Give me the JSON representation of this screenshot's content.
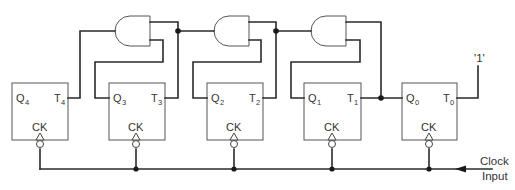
{
  "diagram": {
    "type": "synchronous binary counter (T flip-flops with AND gate carry chain)",
    "flip_flops": [
      {
        "id": "ff4",
        "q_label": "Q",
        "q_sub": "4",
        "t_label": "T",
        "t_sub": "4",
        "ck_label": "CK"
      },
      {
        "id": "ff3",
        "q_label": "Q",
        "q_sub": "3",
        "t_label": "T",
        "t_sub": "3",
        "ck_label": "CK"
      },
      {
        "id": "ff2",
        "q_label": "Q",
        "q_sub": "2",
        "t_label": "T",
        "t_sub": "2",
        "ck_label": "CK"
      },
      {
        "id": "ff1",
        "q_label": "Q",
        "q_sub": "1",
        "t_label": "T",
        "t_sub": "1",
        "ck_label": "CK"
      },
      {
        "id": "ff0",
        "q_label": "Q",
        "q_sub": "0",
        "t_label": "T",
        "t_sub": "0",
        "ck_label": "CK"
      }
    ],
    "gates": [
      {
        "id": "and3",
        "type": "AND",
        "drives": "T4"
      },
      {
        "id": "and2",
        "type": "AND",
        "drives": "T3"
      },
      {
        "id": "and1",
        "type": "AND",
        "drives": "T2"
      }
    ],
    "constant_input": "'1'",
    "clock_label_line1": "Clock",
    "clock_label_line2": "Input"
  }
}
